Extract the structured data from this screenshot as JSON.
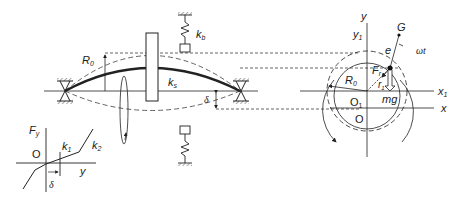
{
  "labels": {
    "R0_left": "R",
    "R0_left_sub": "0",
    "kb": "k",
    "kb_sub": "b",
    "ks": "k",
    "ks_sub": "s",
    "delta_shaft": "δ",
    "Fy": "F",
    "Fy_sub": "y",
    "O_graph": "O",
    "k1": "k",
    "k1_sub": "1",
    "k2": "k",
    "k2_sub": "2",
    "y_graph": "y",
    "delta_graph": "δ",
    "y_axis": "y",
    "y1_axis": "y",
    "y1_sub": "1",
    "G": "G",
    "e": "e",
    "omega_t": "ωt",
    "Fr": "F",
    "Fr_sub": "r",
    "r1": "r",
    "r1_sub": "1",
    "R0_right": "R",
    "R0_right_sub": "0",
    "mg": "mg",
    "O1": "O",
    "O1_sub": "1",
    "O": "O",
    "x1_axis": "x",
    "x1_sub": "1",
    "x_axis": "x"
  },
  "colors": {
    "ink": "#222222",
    "hatch": "#555555",
    "background": "#ffffff"
  }
}
